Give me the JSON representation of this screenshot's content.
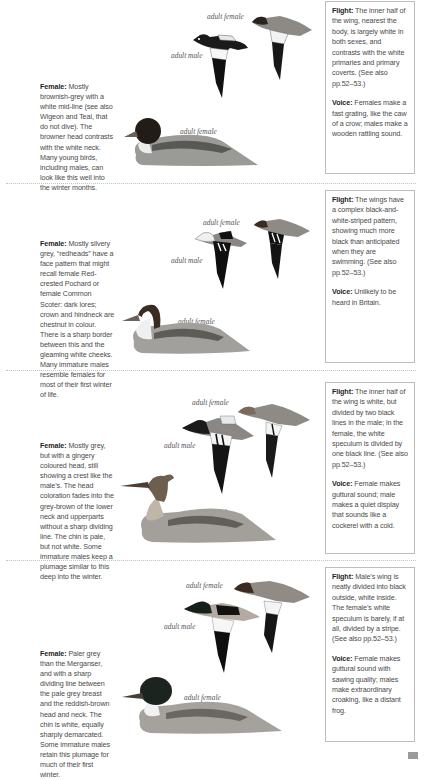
{
  "sections": [
    {
      "species_hint": "Goosander-like / Goldeneye-like diving duck (section 1)",
      "female_heading": "Female:",
      "female_text": "Mostly brownish-grey with a white mid-line (see also Wigeon and Teal, that do not dive). The browner head contrasts with the white neck. Many young birds, including males, can look like this well into the winter months.",
      "labels": {
        "flight_female": "adult female",
        "flight_male": "adult male",
        "swimming_female": "adult female"
      },
      "flight_heading": "Flight:",
      "flight_text": "The inner half of the wing, nearest the body, is largely white in both sexes, and contrasts with the white primaries and primary coverts. (See also pp.52–53.)",
      "voice_heading": "Voice:",
      "voice_text": "Females make a fast grating, like the caw of a crow; males make a wooden rattling sound."
    },
    {
      "female_heading": "Female:",
      "female_text": "Mostly silvery grey, “redheads” have a face pattern that might recall female Red-crested Pochard or female Common Scoter: dark lores; crown and hindneck are chestnut in colour. There is a sharp border between this and the gleaming white cheeks. Many immature males resemble females for most of their first winter of life.",
      "labels": {
        "flight_female": "adult female",
        "flight_male": "adult male",
        "swimming_female": "adult female"
      },
      "flight_heading": "Flight:",
      "flight_text": "The wings have a complex black-and-white-striped pattern, showing much more black than anticipated when they are swimming. (See also pp.52–53.)",
      "voice_heading": "Voice:",
      "voice_text": "Unlikely to be heard in Britain."
    },
    {
      "female_heading": "Female:",
      "female_text": "Mostly grey, but with a gingery coloured head, still showing a crest like the male’s. The head coloration fades into the grey-brown of the lower neck and upperparts without a sharp dividing line. The chin is pale, but not white. Some immature males keep a plumage similar to this deep into the winter.",
      "labels": {
        "flight_female": "adult female",
        "flight_male": "adult male",
        "swimming_female": "adult female"
      },
      "flight_heading": "Flight:",
      "flight_text": "The inner half of the wing is white, but divided by two black lines in the male; in the female, the white speculum is divided by one black line. (See also pp.52–53.)",
      "voice_heading": "Voice:",
      "voice_text": "Female makes guttural sound; male makes a quiet display that sounds like a cockerel with a cold."
    },
    {
      "female_heading": "Female:",
      "female_text": "Paler grey than the Merganser, and with a sharp dividing line between the pale grey breast and the reddish-brown head and neck. The chin is white, equally sharply demarcated. Some immature males retain this plumage for much of their first winter.",
      "labels": {
        "flight_female": "adult female",
        "flight_male": "adult male",
        "swimming_female": "adult female"
      },
      "flight_heading": "Flight:",
      "flight_text": "Male’s wing is neatly divided into black outside, white inside. The female’s white speculum is barely, if at all, divided by a stripe. (See also pp.52–53.)",
      "voice_heading": "Voice:",
      "voice_text": "Female makes guttural sound with sawing quality; males make extraordinary croaking, like a distant frog."
    }
  ],
  "colors": {
    "text": "#4a4a4a",
    "heading": "#1e1e1e",
    "box_border": "#bdbdbd",
    "divider": "#c4c4c4",
    "page_tab": "#9a9a9a"
  }
}
